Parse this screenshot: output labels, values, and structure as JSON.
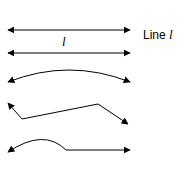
{
  "figure": {
    "legend_label_prefix": "Line",
    "legend_label_symbol": "l",
    "line_symbol": "l",
    "stroke_color": "#000000",
    "items": [
      {
        "id": "straight-line-top",
        "description": "straight line with arrows at both ends"
      },
      {
        "id": "straight-line-labeled",
        "description": "straight line with arrows at both ends labeled l"
      },
      {
        "id": "arc-curve",
        "description": "curved arc with arrows at both ends"
      },
      {
        "id": "broken-line",
        "description": "zigzag broken line with arrows at both ends"
      },
      {
        "id": "mixed-curve",
        "description": "curve then straight segment with arrows at both ends"
      }
    ]
  }
}
